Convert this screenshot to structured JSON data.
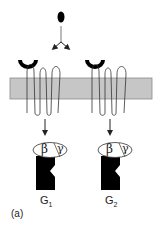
{
  "figure": {
    "panel_label": "(a)",
    "ligand": {
      "shape": "black-oval",
      "color": "#000000"
    },
    "membrane": {
      "color": "#c6c6c6",
      "border": "#8a8a8a"
    },
    "receptors": [
      {
        "id": "receptor-1",
        "binding_site": "black-cup"
      },
      {
        "id": "receptor-2",
        "binding_site": "black-cup"
      }
    ],
    "g_proteins": [
      {
        "name": "G",
        "subscript": "1",
        "beta": "β",
        "gamma": "γ"
      },
      {
        "name": "G",
        "subscript": "2",
        "beta": "β",
        "gamma": "γ"
      }
    ]
  }
}
